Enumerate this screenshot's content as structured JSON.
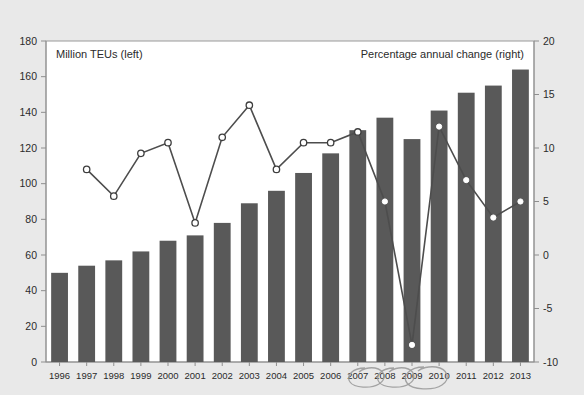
{
  "figure": {
    "background_color": "#e9e9e9",
    "plot_background_color": "#ffffff",
    "bar_color": "#595959",
    "line_color": "#4d4d4d",
    "marker_fill_color": "#ffffff",
    "annotation_color": "#9b9b9b"
  },
  "chart_data": {
    "type": "bar",
    "title": "",
    "subtitle": "",
    "xlabel": "",
    "ylabel": "Million TEUs (left)",
    "y2label": "Percentage annual change (right)",
    "grid": false,
    "legend_position": "in-plot-corners",
    "categories": [
      "1996",
      "1997",
      "1998",
      "1999",
      "2000",
      "2001",
      "2002",
      "2003",
      "2004",
      "2005",
      "2006",
      "2007",
      "2008",
      "2009",
      "2010",
      "2011",
      "2012",
      "2013"
    ],
    "ylim": [
      0,
      180
    ],
    "yticks": [
      0,
      20,
      40,
      60,
      80,
      100,
      120,
      140,
      160,
      180
    ],
    "y2lim": [
      -10,
      20
    ],
    "y2ticks": [
      -10,
      -5,
      0,
      5,
      10,
      15,
      20
    ],
    "series": [
      {
        "name": "Million TEUs (left)",
        "type": "bar",
        "axis": "left",
        "units": "million TEUs",
        "values": [
          50,
          54,
          57,
          62,
          68,
          71,
          78,
          89,
          96,
          106,
          117,
          130,
          137,
          125,
          141,
          151,
          155,
          164
        ]
      },
      {
        "name": "Percentage annual change (right)",
        "type": "line",
        "axis": "right",
        "units": "percent",
        "values": [
          null,
          8.0,
          5.5,
          9.5,
          10.5,
          3.0,
          11.0,
          14.0,
          8.0,
          10.5,
          10.5,
          11.5,
          5.0,
          -8.4,
          12.0,
          7.0,
          3.5,
          5.0
        ]
      }
    ],
    "annotations": [
      {
        "name": "handdrawn-oval-2007",
        "label": "2007",
        "shape": "ellipse"
      },
      {
        "name": "handdrawn-oval-2008",
        "label": "2008",
        "shape": "ellipse"
      },
      {
        "name": "handdrawn-oval-2009",
        "label": "2009",
        "shape": "ellipse"
      }
    ]
  }
}
